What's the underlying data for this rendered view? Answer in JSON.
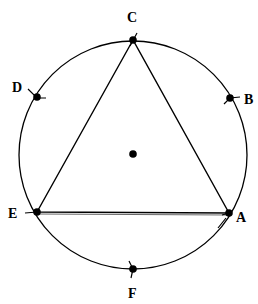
{
  "diagram": {
    "circle": {
      "cx": 133,
      "cy": 155,
      "r": 114,
      "stroke": "#000000"
    },
    "center_point": {
      "x": 133,
      "y": 154
    },
    "points": [
      {
        "id": "C",
        "label": "C",
        "x": 133,
        "y": 40,
        "lx": 126,
        "ly": 22
      },
      {
        "id": "D",
        "label": "D",
        "x": 37,
        "y": 97,
        "lx": 12,
        "ly": 92
      },
      {
        "id": "B",
        "label": "B",
        "x": 230,
        "y": 98,
        "lx": 245,
        "ly": 104
      },
      {
        "id": "E",
        "label": "E",
        "x": 37,
        "y": 212,
        "lx": 8,
        "ly": 218
      },
      {
        "id": "A",
        "label": "A",
        "x": 229,
        "y": 213,
        "lx": 236,
        "ly": 222
      },
      {
        "id": "F",
        "label": "F",
        "x": 133,
        "y": 269,
        "lx": 128,
        "ly": 298
      }
    ],
    "triangle": [
      "C",
      "E",
      "A"
    ]
  }
}
